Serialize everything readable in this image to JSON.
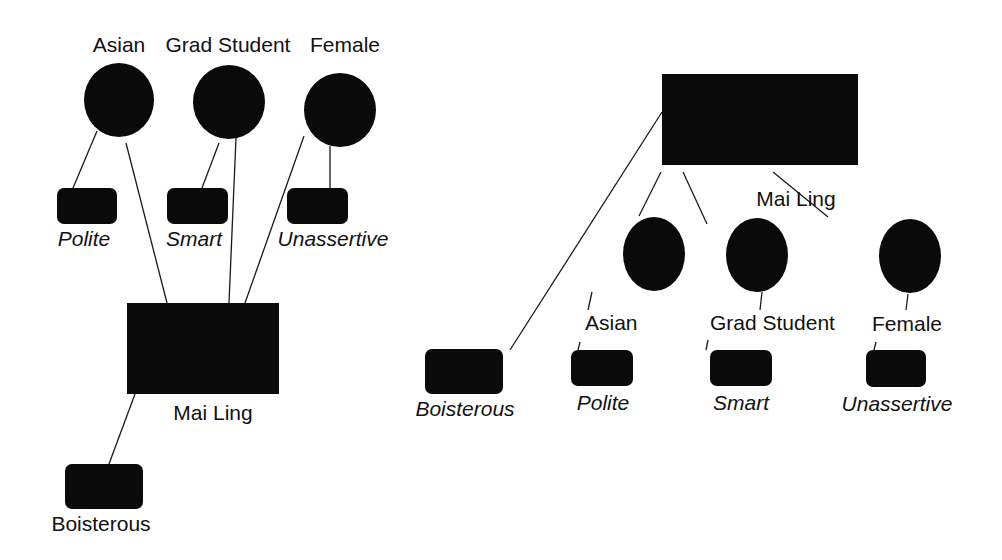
{
  "colors": {
    "node": "#0a0a0a",
    "line": "#1a1a1a",
    "text": "#111111",
    "background": "#ffffff"
  },
  "left_diagram": {
    "categories": [
      {
        "label": "Asian",
        "cx": 119,
        "cy": 100,
        "rx": 35,
        "ry": 37,
        "label_x": 119,
        "label_y": 52
      },
      {
        "label": "Grad Student",
        "cx": 229,
        "cy": 102,
        "rx": 36,
        "ry": 37,
        "label_x": 228,
        "label_y": 52
      },
      {
        "label": "Female",
        "cx": 340,
        "cy": 110,
        "rx": 36,
        "ry": 37,
        "label_x": 345,
        "label_y": 52
      }
    ],
    "traits": [
      {
        "label": "Polite",
        "x": 57,
        "y": 188,
        "w": 60,
        "h": 36,
        "label_x": 84,
        "label_y": 246,
        "italic": true
      },
      {
        "label": "Smart",
        "x": 167,
        "y": 188,
        "w": 61,
        "h": 36,
        "label_x": 194,
        "label_y": 246,
        "italic": true
      },
      {
        "label": "Unassertive",
        "x": 287,
        "y": 188,
        "w": 61,
        "h": 36,
        "label_x": 333,
        "label_y": 246,
        "italic": true
      },
      {
        "label": "Boisterous",
        "x": 65,
        "y": 464,
        "w": 78,
        "h": 45,
        "label_x": 101,
        "label_y": 531,
        "italic": false
      }
    ],
    "person": {
      "label": "Mai Ling",
      "x": 127,
      "y": 303,
      "w": 152,
      "h": 91,
      "label_x": 213,
      "label_y": 420
    },
    "edges": [
      [
        97,
        131,
        73,
        188
      ],
      [
        126,
        143,
        167,
        303
      ],
      [
        219,
        143,
        202,
        188
      ],
      [
        236,
        138,
        229,
        303
      ],
      [
        330,
        146,
        330,
        188
      ],
      [
        304,
        136,
        245,
        303
      ],
      [
        135,
        394,
        109,
        464
      ]
    ]
  },
  "right_diagram": {
    "person": {
      "label": "Mai Ling",
      "x": 662,
      "y": 74,
      "w": 196,
      "h": 91,
      "label_x": 796,
      "label_y": 206
    },
    "categories": [
      {
        "label": "Asian",
        "cx": 654,
        "cy": 254,
        "rx": 31,
        "ry": 37,
        "label_x": 585,
        "label_y": 330,
        "anchor": "start"
      },
      {
        "label": "Grad Student",
        "cx": 757,
        "cy": 255,
        "rx": 31,
        "ry": 37,
        "label_x": 710,
        "label_y": 330,
        "anchor": "start"
      },
      {
        "label": "Female",
        "cx": 910,
        "cy": 256,
        "rx": 31,
        "ry": 37,
        "label_x": 872,
        "label_y": 331,
        "anchor": "start"
      }
    ],
    "traits": [
      {
        "label": "Boisterous",
        "x": 425,
        "y": 349,
        "w": 78,
        "h": 45,
        "label_x": 465,
        "label_y": 416,
        "italic": true
      },
      {
        "label": "Polite",
        "x": 571,
        "y": 350,
        "w": 62,
        "h": 36,
        "label_x": 603,
        "label_y": 410,
        "italic": true
      },
      {
        "label": "Smart",
        "x": 710,
        "y": 350,
        "w": 62,
        "h": 36,
        "label_x": 741,
        "label_y": 410,
        "italic": true
      },
      {
        "label": "Unassertive",
        "x": 866,
        "y": 350,
        "w": 60,
        "h": 37,
        "label_x": 897,
        "label_y": 411,
        "italic": true
      }
    ],
    "edges": [
      [
        662,
        112,
        510,
        350
      ],
      [
        661,
        172,
        639,
        216
      ],
      [
        683,
        172,
        707,
        224
      ],
      [
        773,
        172,
        828,
        217
      ],
      [
        592,
        292,
        588,
        310
      ],
      [
        580,
        342,
        578,
        350
      ],
      [
        762,
        292,
        760,
        310
      ],
      [
        708,
        340,
        706,
        350
      ],
      [
        908,
        294,
        906,
        310
      ],
      [
        876,
        342,
        874,
        350
      ]
    ]
  }
}
